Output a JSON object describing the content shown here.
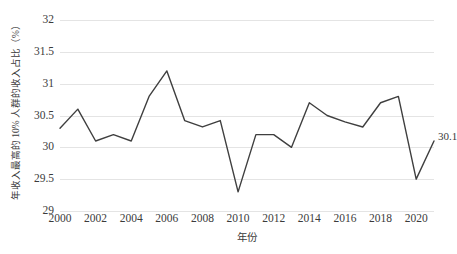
{
  "chart_data": {
    "type": "line",
    "title": "",
    "xlabel": "年份",
    "ylabel": "年收入最高的 10% 人群的收入占比（%）",
    "x": [
      2000,
      2001,
      2002,
      2003,
      2004,
      2005,
      2006,
      2007,
      2008,
      2009,
      2010,
      2011,
      2012,
      2013,
      2014,
      2015,
      2016,
      2017,
      2018,
      2019,
      2020,
      2021
    ],
    "values": [
      30.3,
      30.6,
      30.1,
      30.2,
      30.1,
      30.8,
      31.2,
      30.42,
      30.32,
      30.42,
      29.3,
      30.2,
      30.2,
      30.0,
      30.7,
      30.5,
      30.4,
      30.32,
      30.7,
      30.8,
      29.5,
      30.1
    ],
    "series": [
      {
        "name": "年收入最高的 10% 人群的收入占比",
        "values": [
          30.3,
          30.6,
          30.1,
          30.2,
          30.1,
          30.8,
          31.2,
          30.42,
          30.32,
          30.42,
          29.3,
          30.2,
          30.2,
          30.0,
          30.7,
          30.5,
          30.4,
          30.32,
          30.7,
          30.8,
          29.5,
          30.1
        ]
      }
    ],
    "ylim": [
      29,
      32
    ],
    "xlim": [
      2000,
      2021
    ],
    "y_ticks": [
      "32",
      "31.5",
      "31",
      "30.5",
      "30",
      "29.5",
      "29"
    ],
    "y_tick_values": [
      32,
      31.5,
      31,
      30.5,
      30,
      29.5,
      29
    ],
    "x_ticks": [
      "2000",
      "2002",
      "2004",
      "2006",
      "2008",
      "2010",
      "2012",
      "2014",
      "2016",
      "2018",
      "2020"
    ],
    "x_tick_values": [
      2000,
      2002,
      2004,
      2006,
      2008,
      2010,
      2012,
      2014,
      2016,
      2018,
      2020
    ],
    "grid": "horizontal",
    "legend": "none",
    "annotations": [
      {
        "text": "30.1",
        "x": 2021,
        "y": 30.1
      }
    ],
    "line_color": "#3f3f3f",
    "grid_color": "#e4e4e4",
    "text_color": "#3b3b3b",
    "background_color": "#ffffff"
  }
}
